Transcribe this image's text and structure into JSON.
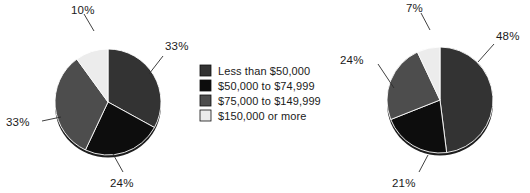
{
  "chart_data": [
    {
      "type": "pie",
      "name": "left-pie-chart",
      "title": "",
      "categories": [
        "Less than $50,000",
        "$50,000 to $74,999",
        "$75,000 to $149,999",
        "$150,000 or more"
      ],
      "values": [
        33,
        24,
        33,
        10
      ],
      "value_labels": [
        "33%",
        "24%",
        "33%",
        "10%"
      ],
      "colors": [
        "#333333",
        "#0d0d0d",
        "#4d4d4d",
        "#ececec"
      ],
      "start_angle_deg": 0,
      "direction": "clockwise",
      "units": "percent",
      "legend": "shared-center"
    },
    {
      "type": "pie",
      "name": "right-pie-chart",
      "title": "",
      "categories": [
        "Less than $50,000",
        "$50,000 to $74,999",
        "$75,000 to $149,999",
        "$150,000 or more"
      ],
      "values": [
        48,
        21,
        24,
        7
      ],
      "value_labels": [
        "48%",
        "21%",
        "24%",
        "7%"
      ],
      "colors": [
        "#333333",
        "#0d0d0d",
        "#4d4d4d",
        "#ececec"
      ],
      "start_angle_deg": 0,
      "direction": "clockwise",
      "units": "percent",
      "legend": "shared-center"
    }
  ],
  "legend": {
    "position": "center",
    "items": [
      {
        "label": "Less than $50,000",
        "color": "#333333"
      },
      {
        "label": "$50,000 to $74,999",
        "color": "#0d0d0d"
      },
      {
        "label": "$75,000 to $149,999",
        "color": "#4d4d4d"
      },
      {
        "label": "$150,000 or more",
        "color": "#ececec"
      }
    ]
  },
  "left_chart": {
    "labels": {
      "top": "10%",
      "right": "33%",
      "bottom": "24%",
      "left": "33%"
    }
  },
  "right_chart": {
    "labels": {
      "top": "7%",
      "right": "48%",
      "bottom": "21%",
      "left": "24%"
    }
  }
}
